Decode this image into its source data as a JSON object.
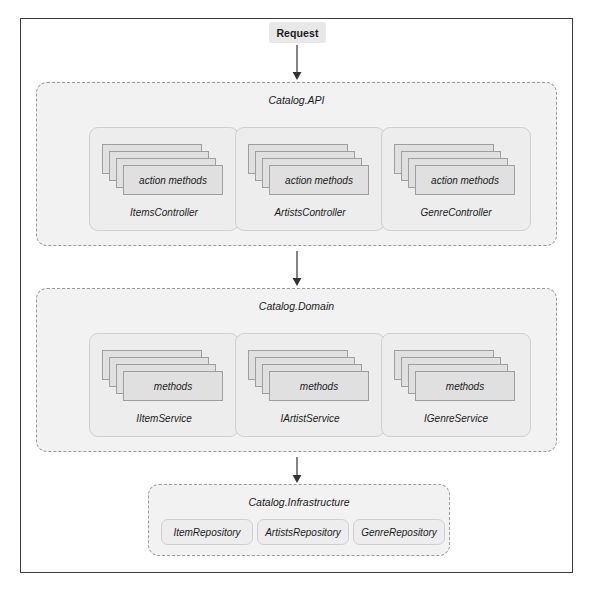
{
  "diagram": {
    "entry": {
      "label": "Request"
    },
    "layers": [
      {
        "id": "api",
        "title": "Catalog.API",
        "geometry": {
          "left": 36,
          "top": 82,
          "width": 521,
          "height": 164
        },
        "groups": [
          {
            "name": "ItemsController",
            "stack_label": "action methods",
            "stack_count": 4,
            "geometry": {
              "left": 52,
              "top": 44,
              "width": 150,
              "height": 104
            }
          },
          {
            "name": "ArtistsController",
            "stack_label": "action methods",
            "stack_count": 4,
            "geometry": {
              "left": 198,
              "top": 44,
              "width": 150,
              "height": 104
            }
          },
          {
            "name": "GenreController",
            "stack_label": "action methods",
            "stack_count": 4,
            "geometry": {
              "left": 344,
              "top": 44,
              "width": 150,
              "height": 104
            }
          }
        ]
      },
      {
        "id": "domain",
        "title": "Catalog.Domain",
        "geometry": {
          "left": 36,
          "top": 288,
          "width": 521,
          "height": 164
        },
        "groups": [
          {
            "name": "IItemService",
            "stack_label": "methods",
            "stack_count": 4,
            "geometry": {
              "left": 52,
              "top": 44,
              "width": 150,
              "height": 104
            }
          },
          {
            "name": "IArtistService",
            "stack_label": "methods",
            "stack_count": 4,
            "geometry": {
              "left": 198,
              "top": 44,
              "width": 150,
              "height": 104
            }
          },
          {
            "name": "IGenreService",
            "stack_label": "methods",
            "stack_count": 4,
            "geometry": {
              "left": 344,
              "top": 44,
              "width": 150,
              "height": 104
            }
          }
        ]
      }
    ],
    "infrastructure": {
      "id": "infrastructure",
      "title": "Catalog.Infrastructure",
      "geometry": {
        "left": 148,
        "top": 484,
        "width": 302,
        "height": 72
      },
      "repositories": [
        {
          "name": "ItemRepository",
          "geometry": {
            "left": 12,
            "top": 34,
            "width": 92
          }
        },
        {
          "name": "ArtistsRepository",
          "geometry": {
            "left": 108,
            "top": 34,
            "width": 92
          }
        },
        {
          "name": "GenreRepository",
          "geometry": {
            "left": 204,
            "top": 34,
            "width": 92
          }
        }
      ]
    },
    "arrows": [
      {
        "id": "request-to-api",
        "top": 45,
        "height": 35
      },
      {
        "id": "api-to-domain",
        "top": 251,
        "height": 35
      },
      {
        "id": "domain-to-infrastructure",
        "top": 457,
        "height": 26
      }
    ],
    "colors": {
      "frame_border": "#3a3a3a",
      "layer_fill": "#f2f2f2",
      "layer_border": "#9a9a9a",
      "group_fill": "#ededed",
      "group_border": "#cfcfcf",
      "card_fill": "#e0e0e0",
      "card_border": "#9e9e9e",
      "badge_fill": "#e8e8e8",
      "arrow": "#333333",
      "text": "#1a1a1a"
    }
  }
}
